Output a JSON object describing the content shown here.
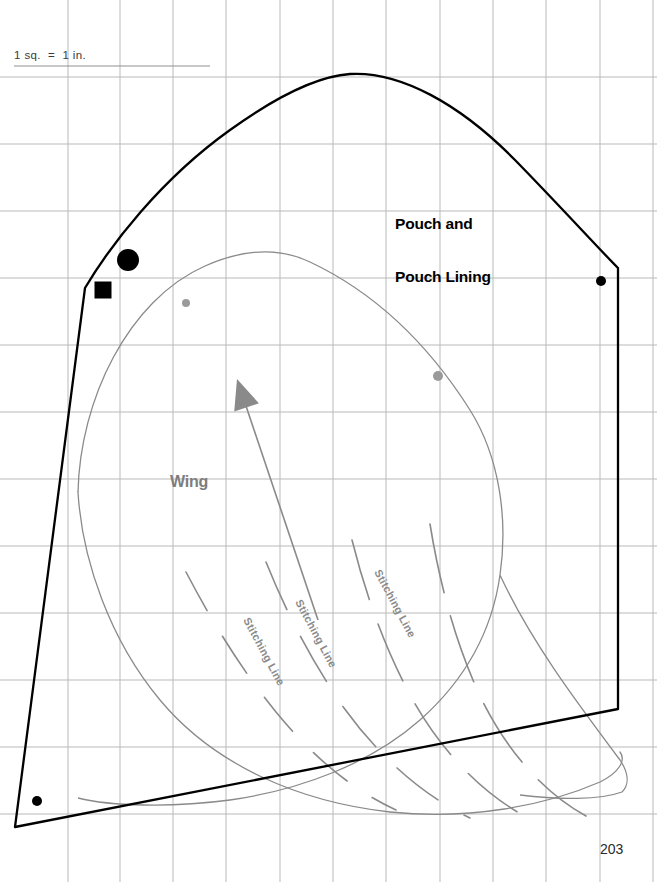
{
  "page": {
    "number": "203",
    "background_color": "#ffffff",
    "width": 657,
    "height": 882
  },
  "grid": {
    "label": "1 sq.  =  1 in.",
    "color": "#b9b9b9",
    "x_lines": [
      68,
      120,
      173,
      226,
      280,
      333,
      386,
      440,
      493,
      546,
      600,
      653
    ],
    "y_lines": [
      77,
      144,
      211,
      278,
      345,
      412,
      479,
      546,
      613,
      680,
      747,
      814
    ],
    "spacing_px": 53
  },
  "pieces": [
    {
      "name": "pouch-and-pouch-lining",
      "title": "Pouch and\nPouch Lining",
      "title_line1": "Pouch and",
      "title_line2": "Pouch Lining",
      "color": "#000000",
      "line_width": 2.2
    },
    {
      "name": "wing",
      "title": "Wing",
      "color": "#8a8a8a",
      "line_width": 1.3
    }
  ],
  "stitching_lines": [
    {
      "label": "Stitching Line",
      "x": 243,
      "y": 620,
      "rotation": 62
    },
    {
      "label": "Stitching Line",
      "x": 295,
      "y": 602,
      "rotation": 62
    },
    {
      "label": "Stitching Line",
      "x": 374,
      "y": 572,
      "rotation": 62
    }
  ],
  "markers": [
    {
      "name": "large-dot-marker",
      "shape": "circle",
      "x": 128,
      "y": 260,
      "r": 11,
      "color": "#000000"
    },
    {
      "name": "square-marker",
      "shape": "square",
      "x": 103,
      "y": 290,
      "size": 17,
      "color": "#000000"
    },
    {
      "name": "notch-dot-right",
      "shape": "circle",
      "x": 601,
      "y": 281,
      "r": 5,
      "color": "#000000"
    },
    {
      "name": "notch-dot-bottom-left",
      "shape": "circle",
      "x": 37,
      "y": 801,
      "r": 5,
      "color": "#000000"
    },
    {
      "name": "wing-dot-upper-left",
      "shape": "circle",
      "x": 186,
      "y": 303,
      "r": 4,
      "color": "#9a9a9a"
    },
    {
      "name": "wing-dot-right",
      "shape": "circle",
      "x": 438,
      "y": 376,
      "r": 5,
      "color": "#9a9a9a"
    }
  ],
  "grain_arrow": {
    "name": "grain-line-arrow",
    "color": "#8a8a8a",
    "tip_x": 237,
    "tip_y": 379,
    "tail_x": 318,
    "tail_y": 620
  }
}
